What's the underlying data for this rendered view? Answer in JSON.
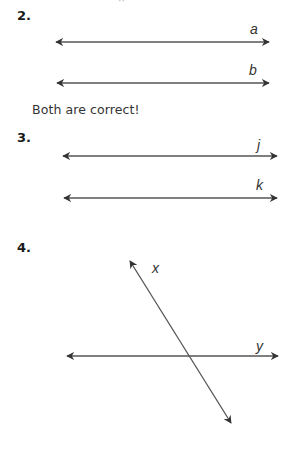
{
  "problems": [
    {
      "number": "2.",
      "lines": [
        {
          "label": "a",
          "x1": 56,
          "y1": 42,
          "x2": 269,
          "y2": 42
        },
        {
          "label": "b",
          "x1": 57,
          "y1": 83,
          "x2": 269,
          "y2": 83
        }
      ],
      "answer": "Both are correct!"
    },
    {
      "number": "3.",
      "lines": [
        {
          "label": "j",
          "x1": 63,
          "y1": 156,
          "x2": 277,
          "y2": 156
        },
        {
          "label": "k",
          "x1": 64,
          "y1": 198,
          "x2": 277,
          "y2": 198
        }
      ]
    },
    {
      "number": "4.",
      "lines": [
        {
          "label": "x",
          "x1": 130,
          "y1": 261,
          "x2": 231,
          "y2": 423
        },
        {
          "label": "y",
          "x1": 67,
          "y1": 356,
          "x2": 278,
          "y2": 356
        }
      ]
    }
  ],
  "colors": {
    "line": "#555555",
    "arrowhead": "#333333",
    "text": "#222222"
  }
}
